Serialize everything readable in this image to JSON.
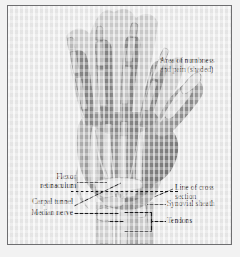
{
  "figure": {
    "background_color": "#ececec",
    "frame_color": "#6e6e70",
    "text_color": "#19191b",
    "leader_color": "#1c1c1e"
  },
  "annotations": {
    "area_of_numbness": "Area of numbness\nand pain (shaded)",
    "flexor_retinaculum": "Flexor\nretinaculum",
    "carpal_tunnel": "Carpal tunnel",
    "median_nerve": "Median nerve",
    "line_of_cross_section": "Line of cross\nsection",
    "synovial_sheath": "Synovial sheath",
    "tendons": "Tendons"
  },
  "illustration": {
    "view": "palmar view of right hand and wrist",
    "parts": [
      "index-finger",
      "middle-finger",
      "ring-finger",
      "little-finger",
      "thumb",
      "palm",
      "metacarpals",
      "flexor-tendons",
      "flexor-retinaculum",
      "carpal-bones",
      "radius",
      "ulna",
      "median-nerve",
      "synovial-sheath"
    ],
    "shading_note": "digits and radial palm rendered darker to mark the numb area",
    "tones": {
      "skin_light": "#c9c9c9",
      "skin_mid": "#a3a3a3",
      "skin_shaded": "#8a8a8a",
      "bone_light": "#dcdcdc",
      "bone_outline": "#6a6a6a",
      "tendon": "#d2d2d2",
      "deep_shadow": "#5d5d5f"
    }
  }
}
